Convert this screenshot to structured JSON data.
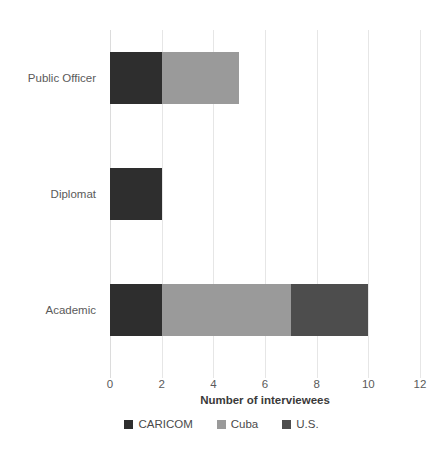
{
  "chart_data": {
    "type": "bar",
    "orientation": "horizontal",
    "stacked": true,
    "title": "",
    "xlabel": "Number of interviewees",
    "ylabel": "Area of work",
    "categories": [
      "Academic",
      "Diplomat",
      "Public Officer"
    ],
    "categories_top_to_bottom": [
      "Public Officer",
      "Diplomat",
      "Academic"
    ],
    "series": [
      {
        "name": "CARICOM",
        "color": "#2e2e2e",
        "values": [
          2,
          2,
          2
        ]
      },
      {
        "name": "Cuba",
        "color": "#9a9a9a",
        "values": [
          5,
          0,
          3
        ]
      },
      {
        "name": "U.S.",
        "color": "#4d4d4d",
        "values": [
          3,
          0,
          0
        ]
      }
    ],
    "totals": [
      10,
      2,
      5
    ],
    "xlim": [
      0,
      12
    ],
    "xticks": [
      0,
      2,
      4,
      6,
      8,
      10,
      12
    ],
    "xtick_labels": [
      "0",
      "2",
      "4",
      "6",
      "8",
      "10",
      "12"
    ],
    "grid": true,
    "grid_axis": "x",
    "grid_color": "#e6e6e6",
    "legend_position": "bottom",
    "background": "#ffffff"
  },
  "axes": {
    "x_title": "Number of interviewees",
    "y_title": "Area of work"
  },
  "legend": {
    "items": [
      {
        "label": "CARICOM",
        "color": "#2e2e2e"
      },
      {
        "label": "Cuba",
        "color": "#9a9a9a"
      },
      {
        "label": "U.S.",
        "color": "#4d4d4d"
      }
    ]
  }
}
